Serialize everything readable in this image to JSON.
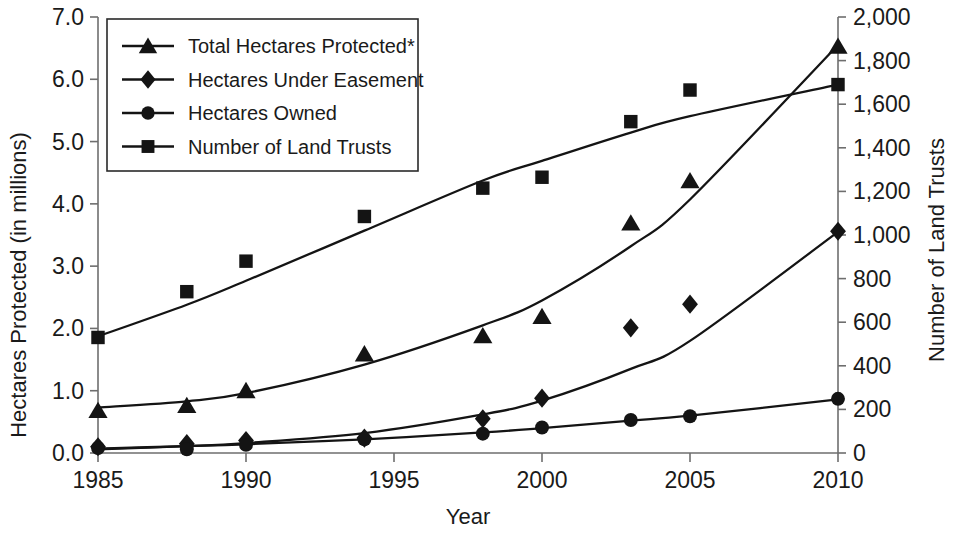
{
  "chart_data": {
    "type": "line",
    "title": "",
    "subtitle": "",
    "xlabel": "Year",
    "ylabel": "Hectares Protected (in millions)",
    "y2label": "Number of Land Trusts",
    "grid": false,
    "legend_position": "top-left",
    "x": [
      1985,
      1988,
      1990,
      1994,
      1998,
      2000,
      2003,
      2005,
      2010
    ],
    "xlim": [
      1985,
      2010
    ],
    "xticks": [
      1985,
      1990,
      1995,
      2000,
      2005,
      2010
    ],
    "xtick_labels": [
      "1985",
      "1990",
      "1995",
      "2000",
      "2005",
      "2010"
    ],
    "ylim": [
      0.0,
      7.0
    ],
    "yticks": [
      0.0,
      1.0,
      2.0,
      3.0,
      4.0,
      5.0,
      6.0,
      7.0
    ],
    "ytick_labels": [
      "0.0",
      "1.0",
      "2.0",
      "3.0",
      "4.0",
      "5.0",
      "6.0",
      "7.0"
    ],
    "y2lim": [
      0,
      2000
    ],
    "y2ticks": [
      0,
      200,
      400,
      600,
      800,
      1000,
      1200,
      1400,
      1600,
      1800,
      2000
    ],
    "y2tick_labels": [
      "0",
      "200",
      "400",
      "600",
      "800",
      "1,000",
      "1,200",
      "1,400",
      "1,600",
      "1,800",
      "2,000"
    ],
    "series": [
      {
        "name": "Total Hectares Protected*",
        "axis": "left",
        "marker": "triangle",
        "color": "#141414",
        "values": [
          0.68,
          0.76,
          1.0,
          1.59,
          1.88,
          2.19,
          3.69,
          4.37,
          6.53
        ]
      },
      {
        "name": "Hectares Under Easement",
        "axis": "left",
        "marker": "diamond",
        "color": "#141414",
        "values": [
          0.1,
          0.15,
          0.2,
          0.24,
          0.55,
          0.88,
          2.01,
          2.39,
          3.56
        ]
      },
      {
        "name": "Hectares Owned",
        "axis": "left",
        "marker": "circle",
        "color": "#141414",
        "values": [
          0.08,
          0.06,
          0.13,
          0.22,
          0.31,
          0.41,
          0.53,
          0.59,
          0.87
        ]
      },
      {
        "name": "Number of Land Trusts",
        "axis": "right",
        "marker": "square",
        "color": "#141414",
        "values": [
          530,
          740,
          880,
          1085,
          1215,
          1265,
          1520,
          1665,
          1690
        ]
      }
    ],
    "trend_curves": {
      "Total Hectares Protected*": [
        [
          1985,
          0.73
        ],
        [
          1988,
          0.83
        ],
        [
          1990,
          0.96
        ],
        [
          1994,
          1.42
        ],
        [
          1998,
          2.05
        ],
        [
          2000,
          2.45
        ],
        [
          2003,
          3.32
        ],
        [
          2005,
          4.07
        ],
        [
          2010,
          6.55
        ]
      ],
      "Hectares Under Easement": [
        [
          1985,
          0.06
        ],
        [
          1988,
          0.11
        ],
        [
          1990,
          0.16
        ],
        [
          1994,
          0.32
        ],
        [
          1998,
          0.62
        ],
        [
          2000,
          0.84
        ],
        [
          2003,
          1.35
        ],
        [
          2005,
          1.8
        ],
        [
          2010,
          3.55
        ]
      ],
      "Hectares Owned": [
        [
          1985,
          0.07
        ],
        [
          1988,
          0.11
        ],
        [
          1990,
          0.14
        ],
        [
          1994,
          0.22
        ],
        [
          1998,
          0.33
        ],
        [
          2000,
          0.4
        ],
        [
          2003,
          0.52
        ],
        [
          2005,
          0.6
        ],
        [
          2010,
          0.86
        ]
      ],
      "Number of Land Trusts": [
        [
          1985,
          535
        ],
        [
          1988,
          680
        ],
        [
          1990,
          790
        ],
        [
          1994,
          1020
        ],
        [
          1998,
          1250
        ],
        [
          2000,
          1340
        ],
        [
          2003,
          1470
        ],
        [
          2005,
          1545
        ],
        [
          2010,
          1690
        ]
      ]
    }
  },
  "axis_notes": {
    "footnote_marker": "*"
  }
}
